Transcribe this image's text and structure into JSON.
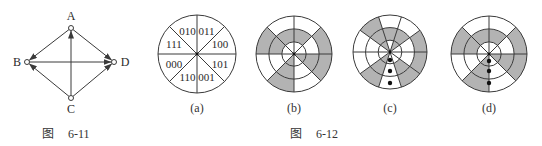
{
  "colors": {
    "line": "#3a3a3a",
    "shade": "#b3b3b3",
    "paper": "#ffffff",
    "dot": "#111111"
  },
  "figure_6_11": {
    "caption": {
      "prefix": "图",
      "number": "6-11"
    },
    "nodes": [
      {
        "id": "A",
        "label": "A",
        "x": 71,
        "y": 28,
        "lx": 71,
        "ly": 20
      },
      {
        "id": "B",
        "label": "B",
        "x": 27,
        "y": 62,
        "lx": 17,
        "ly": 66
      },
      {
        "id": "C",
        "label": "C",
        "x": 71,
        "y": 98,
        "lx": 71,
        "ly": 113
      },
      {
        "id": "D",
        "label": "D",
        "x": 114,
        "y": 62,
        "lx": 125,
        "ly": 66
      }
    ],
    "edges": [
      {
        "from": "A",
        "to": "B"
      },
      {
        "from": "A",
        "to": "D"
      },
      {
        "from": "C",
        "to": "A"
      },
      {
        "from": "B",
        "to": "D"
      },
      {
        "from": "C",
        "to": "B"
      },
      {
        "from": "C",
        "to": "D"
      }
    ]
  },
  "figure_6_12": {
    "caption": {
      "prefix": "图",
      "number": "6-12"
    },
    "panels": [
      {
        "id": "a",
        "label": "(a)",
        "cx": 197,
        "cy": 54,
        "r": 39,
        "sectors": 8,
        "offset_deg": 0,
        "codes": [
          "011",
          "100",
          "101",
          "001",
          "110",
          "000",
          "111",
          "010"
        ]
      },
      {
        "id": "b",
        "label": "(b)",
        "cx": 294,
        "cy": 54,
        "r": 38,
        "sectors": 8,
        "offset_deg": 0,
        "ring_radii": [
          0.32,
          0.66,
          1.0
        ],
        "shading": {
          "inner": [
            0,
            0,
            1,
            0,
            1,
            0,
            0,
            0
          ],
          "middle": [
            1,
            0,
            1,
            0,
            1,
            0,
            1,
            1
          ],
          "outer": [
            0,
            1,
            1,
            0,
            1,
            0,
            1,
            0
          ]
        },
        "dots": []
      },
      {
        "id": "c",
        "label": "(c)",
        "cx": 390,
        "cy": 52,
        "r": 37,
        "sectors": 10,
        "offset_deg": -18,
        "ring_radii": [
          0.32,
          0.66,
          1.0
        ],
        "shading": {
          "inner": [
            0,
            1,
            0,
            0,
            0,
            0,
            1,
            0,
            0,
            1
          ],
          "middle": [
            1,
            1,
            0,
            0,
            1,
            0,
            1,
            0,
            0,
            1
          ],
          "outer": [
            0,
            0,
            1,
            1,
            1,
            0,
            1,
            0,
            0,
            1
          ]
        },
        "dots": [
          {
            "x": 390,
            "y": 60
          },
          {
            "x": 390,
            "y": 71
          },
          {
            "x": 390,
            "y": 83
          }
        ]
      },
      {
        "id": "d",
        "label": "(d)",
        "cx": 489,
        "cy": 54,
        "r": 38,
        "sectors": 8,
        "offset_deg": 0,
        "ring_radii": [
          0.32,
          0.66,
          1.0
        ],
        "shading": {
          "inner": [
            0,
            0,
            1,
            0,
            1,
            0,
            0,
            0
          ],
          "middle": [
            1,
            0,
            1,
            0,
            1,
            0,
            1,
            1
          ],
          "outer": [
            0,
            1,
            1,
            0,
            1,
            0,
            1,
            0
          ]
        },
        "dots": [
          {
            "x": 489,
            "y": 61
          },
          {
            "x": 489,
            "y": 71
          },
          {
            "x": 489,
            "y": 83
          }
        ]
      }
    ]
  }
}
